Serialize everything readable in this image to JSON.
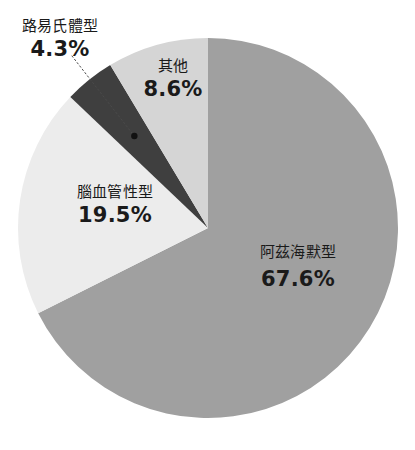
{
  "chart_data": {
    "type": "pie",
    "title": "",
    "subtitle": "",
    "xlabel": "",
    "ylabel": "",
    "legend_position": "none",
    "grid": false,
    "unit": "%",
    "start_angle_deg": 0,
    "direction": "clockwise",
    "categories": [
      "阿茲海默型",
      "腦血管性型",
      "路易氏體型",
      "其他"
    ],
    "values": [
      67.6,
      19.5,
      4.3,
      8.6
    ],
    "labels": [
      "67.6%",
      "19.5%",
      "4.3%",
      "8.6%"
    ],
    "colors": [
      "#a0a0a0",
      "#ececec",
      "#3f3f3f",
      "#d5d5d5"
    ],
    "slices": [
      {
        "name": "阿茲海默型",
        "value": 67.6,
        "label": "67.6%",
        "color": "#a0a0a0",
        "start_angle": 0,
        "end_angle": 243.36,
        "has_leader_line": false
      },
      {
        "name": "腦血管性型",
        "value": 19.5,
        "label": "19.5%",
        "color": "#ececec",
        "start_angle": 243.36,
        "end_angle": 313.56,
        "has_leader_line": false
      },
      {
        "name": "路易氏體型",
        "value": 4.3,
        "label": "4.3%",
        "color": "#3f3f3f",
        "start_angle": 313.56,
        "end_angle": 329.04,
        "has_leader_line": true
      },
      {
        "name": "其他",
        "value": 8.6,
        "label": "8.6%",
        "color": "#d5d5d5",
        "start_angle": 329.04,
        "end_angle": 360,
        "has_leader_line": false
      }
    ]
  },
  "canvas": {
    "background": "#ffffff",
    "text_color": "#1a1a1a",
    "leader_line_color": "#4a4a4a",
    "marker_color": "#111111"
  }
}
